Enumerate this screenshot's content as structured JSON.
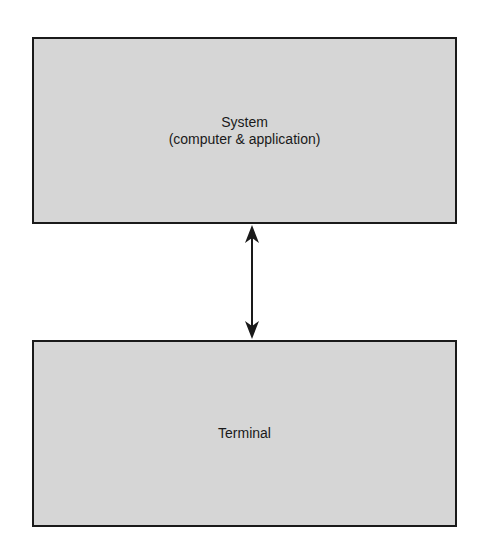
{
  "diagram": {
    "nodes": [
      {
        "id": "system",
        "title": "System",
        "subtitle": "(computer & application)"
      },
      {
        "id": "terminal",
        "title": "Terminal"
      }
    ],
    "edges": [
      {
        "from": "system",
        "to": "terminal",
        "type": "bidirectional-arrow"
      }
    ],
    "colors": {
      "box_fill": "#d6d6d6",
      "box_border": "#1a1a1a",
      "text": "#1a1a1a",
      "arrow": "#1a1a1a",
      "background": "#ffffff"
    }
  }
}
